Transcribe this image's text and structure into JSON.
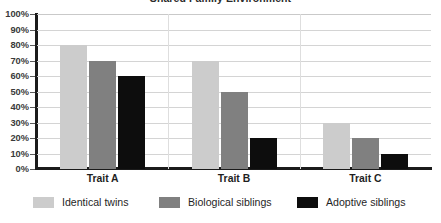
{
  "chart_data": {
    "type": "bar",
    "title": "Shared Family Environment",
    "xlabel": "",
    "ylabel": "",
    "categories": [
      "Trait A",
      "Trait B",
      "Trait C"
    ],
    "series": [
      {
        "name": "Identical twins",
        "color": "#cccccc",
        "values": [
          80,
          70,
          30
        ]
      },
      {
        "name": "Biological siblings",
        "color": "#808080",
        "values": [
          70,
          50,
          20
        ]
      },
      {
        "name": "Adoptive siblings",
        "color": "#0d0d0d",
        "values": [
          60,
          20,
          10
        ]
      }
    ],
    "ylim": [
      0,
      100
    ],
    "ytick_step": 10,
    "ytick_labels": [
      "0%",
      "10%",
      "20%",
      "30%",
      "40%",
      "50%",
      "60%",
      "70%",
      "80%",
      "90%",
      "100%"
    ],
    "grid": true,
    "grid_axis": "y",
    "legend_position": "bottom",
    "value_suffix": "%"
  },
  "axis": {
    "y_axis_color": "#1b1b1b",
    "x_axis_color": "#1b1b1b",
    "gridline_color": "#d4d4d4"
  }
}
